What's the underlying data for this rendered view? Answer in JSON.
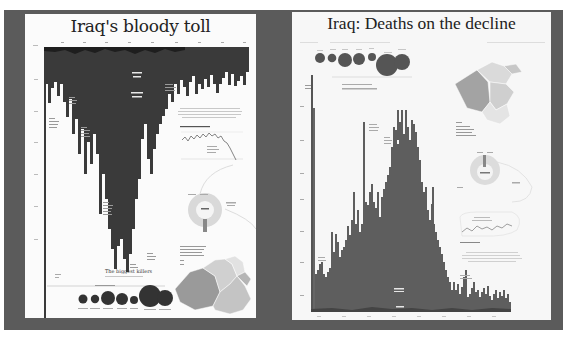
{
  "left_panel": {
    "title": "Iraq's bloody toll",
    "subtitle_killers": "The biggest killers",
    "chart_type": "inverted bar (deaths per month, hanging from top axis)",
    "bubble_count": 7,
    "has_map": true,
    "has_donut": true,
    "has_line_inset": true
  },
  "right_panel": {
    "title": "Iraq: Deaths on the decline",
    "chart_type": "bar (deaths per month)",
    "bubble_count": 7,
    "has_map": true,
    "has_donut": true,
    "has_line_inset": true
  },
  "colors": {
    "background": "#5b5b5b",
    "panel": "#fbfbfb",
    "bar_left": "#3c3c3c",
    "bar_right": "#5e5e5e",
    "map_dark": "#8a8a8a",
    "map_light": "#d6d6d6"
  }
}
